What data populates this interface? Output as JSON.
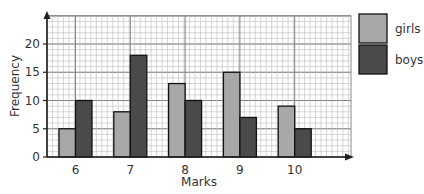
{
  "chart_data": {
    "type": "bar",
    "title": "",
    "xlabel": "Marks",
    "ylabel": "Frequency",
    "categories": [
      "6",
      "7",
      "8",
      "9",
      "10"
    ],
    "series": [
      {
        "name": "girls",
        "values": [
          5,
          8,
          13,
          15,
          9
        ],
        "color": "#a8a8a8"
      },
      {
        "name": "boys",
        "values": [
          10,
          18,
          10,
          7,
          5
        ],
        "color": "#4a4a4a"
      }
    ],
    "ylim": [
      0,
      25
    ],
    "yticks": [
      0,
      5,
      10,
      15,
      20
    ],
    "grid": true,
    "legend_position": "right"
  }
}
